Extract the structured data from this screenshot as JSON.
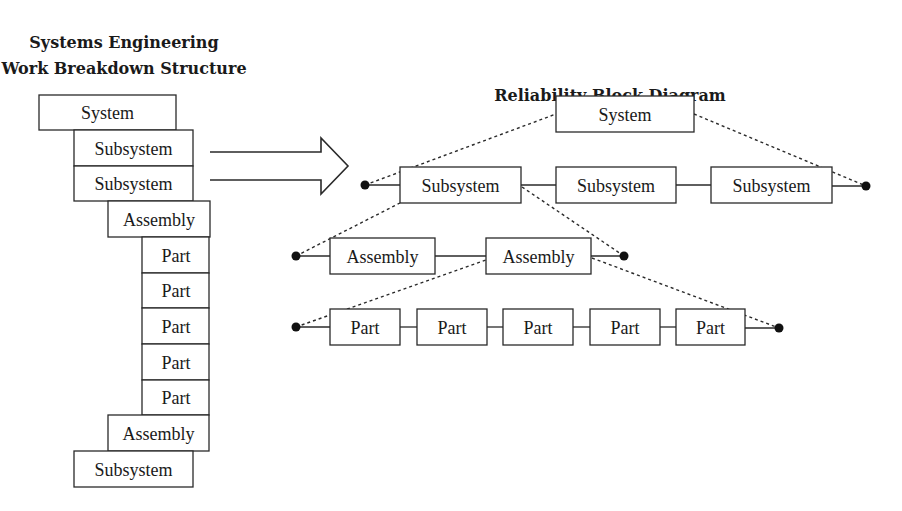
{
  "wbs": {
    "title_line1": "Systems Engineering",
    "title_line2": "Work Breakdown Structure",
    "items": [
      {
        "label": "System",
        "level": 0
      },
      {
        "label": "Subsystem",
        "level": 1
      },
      {
        "label": "Subsystem",
        "level": 1
      },
      {
        "label": "Assembly",
        "level": 2
      },
      {
        "label": "Part",
        "level": 3
      },
      {
        "label": "Part",
        "level": 3
      },
      {
        "label": "Part",
        "level": 3
      },
      {
        "label": "Part",
        "level": 3
      },
      {
        "label": "Part",
        "level": 3
      },
      {
        "label": "Assembly",
        "level": 2
      },
      {
        "label": "Subsystem",
        "level": 1
      }
    ]
  },
  "rbd": {
    "title": "Reliability Block Diagram",
    "system": {
      "label": "System"
    },
    "subsystems": [
      {
        "label": "Subsystem"
      },
      {
        "label": "Subsystem"
      },
      {
        "label": "Subsystem"
      }
    ],
    "assemblies": [
      {
        "label": "Assembly"
      },
      {
        "label": "Assembly"
      }
    ],
    "parts": [
      {
        "label": "Part"
      },
      {
        "label": "Part"
      },
      {
        "label": "Part"
      },
      {
        "label": "Part"
      },
      {
        "label": "Part"
      }
    ]
  }
}
